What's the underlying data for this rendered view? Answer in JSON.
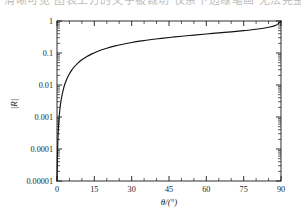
{
  "page": {
    "top_clipped_text": "清晰可见 图表上方的文字被裁切 仅余下边缘笔画 无法完整辨识"
  },
  "chart_data": {
    "type": "line",
    "title": "",
    "subtitle": "",
    "xlabel": "θ/(°)",
    "ylabel": "|R|",
    "xscale": "linear",
    "yscale": "log",
    "xlim": [
      0,
      90
    ],
    "ylim": [
      1e-05,
      1
    ],
    "grid": false,
    "legend": null,
    "legend_position": "none",
    "x_ticks": [
      0,
      15,
      30,
      45,
      60,
      75,
      90
    ],
    "x_tick_labels": [
      "0",
      "15",
      "30",
      "45",
      "60",
      "75",
      "90"
    ],
    "x_minor_step": 5,
    "y_ticks": [
      1,
      0.1,
      0.01,
      0.001,
      0.0001,
      1e-05
    ],
    "y_tick_labels": [
      "1",
      "0.1",
      "0.01",
      "0.001",
      "0.0001",
      "0.00001"
    ],
    "series": [
      {
        "name": "|R|",
        "color": "#111111",
        "x": [
          0,
          0.05,
          0.1,
          0.2,
          0.3,
          0.45,
          0.6,
          0.8,
          1.0,
          1.3,
          1.6,
          2.0,
          2.5,
          3.0,
          3.5,
          4.0,
          5.0,
          6.0,
          7.0,
          8.0,
          9.0,
          10.0,
          12.0,
          14.0,
          16.0,
          18.0,
          20.0,
          23.0,
          26.0,
          30.0,
          34.0,
          38.0,
          42.0,
          46.0,
          50.0,
          55.0,
          60.0,
          65.0,
          70.0,
          75.0,
          80.0,
          85.0,
          88.0,
          90.0
        ],
        "y": [
          1e-05,
          1.55e-05,
          2.6e-05,
          6.9e-05,
          0.000138,
          0.00029,
          0.0005,
          0.00087,
          0.00133,
          0.00216,
          0.00314,
          0.0047,
          0.0071,
          0.0098,
          0.0127,
          0.0158,
          0.0225,
          0.0298,
          0.0374,
          0.0452,
          0.0532,
          0.0612,
          0.0775,
          0.0938,
          0.1098,
          0.1256,
          0.1411,
          0.1635,
          0.1851,
          0.2126,
          0.2387,
          0.2636,
          0.2876,
          0.3111,
          0.3342,
          0.3633,
          0.3931,
          0.4245,
          0.4591,
          0.5,
          0.5531,
          0.6365,
          0.735,
          1.0
        ]
      }
    ]
  },
  "axes": {
    "y_axis_title": "|R|",
    "x_axis_title": "θ/(°)"
  }
}
